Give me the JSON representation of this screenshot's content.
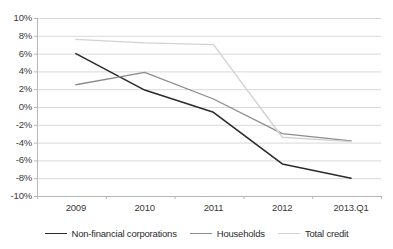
{
  "chart_data": {
    "type": "line",
    "title": "",
    "xlabel": "",
    "ylabel": "",
    "x": [
      "2009",
      "2010",
      "2011",
      "2012",
      "2013.Q1"
    ],
    "categories": [
      "2009",
      "2010",
      "2011",
      "2012",
      "2013.Q1"
    ],
    "ylim": [
      -10,
      10
    ],
    "yticks": [
      10,
      8,
      6,
      4,
      2,
      0,
      -2,
      -4,
      -6,
      -8,
      -10
    ],
    "ytick_labels": [
      "10%",
      "8%",
      "6%",
      "4%",
      "2%",
      "0%",
      "-2%",
      "-4%",
      "-6%",
      "-8%",
      "-10%"
    ],
    "grid": true,
    "grid_axis": "y",
    "legend_position": "bottom",
    "series": [
      {
        "name": "Non-financial corporations",
        "color": "#2b2b2b",
        "width": 1.6,
        "values": [
          6.0,
          1.9,
          -0.6,
          -6.4,
          -8.0
        ]
      },
      {
        "name": "Households",
        "color": "#8c8c8c",
        "width": 1.3,
        "values": [
          2.5,
          3.9,
          0.9,
          -3.0,
          -3.8
        ]
      },
      {
        "name": "Total credit",
        "color": "#d2d2d2",
        "width": 1.3,
        "values": [
          7.6,
          7.2,
          7.0,
          -3.4,
          -3.9
        ]
      }
    ]
  },
  "axis": {
    "axis_color": "#b7b7b7",
    "grid_color": "#d9d9d9",
    "tick_color": "#b7b7b7"
  }
}
